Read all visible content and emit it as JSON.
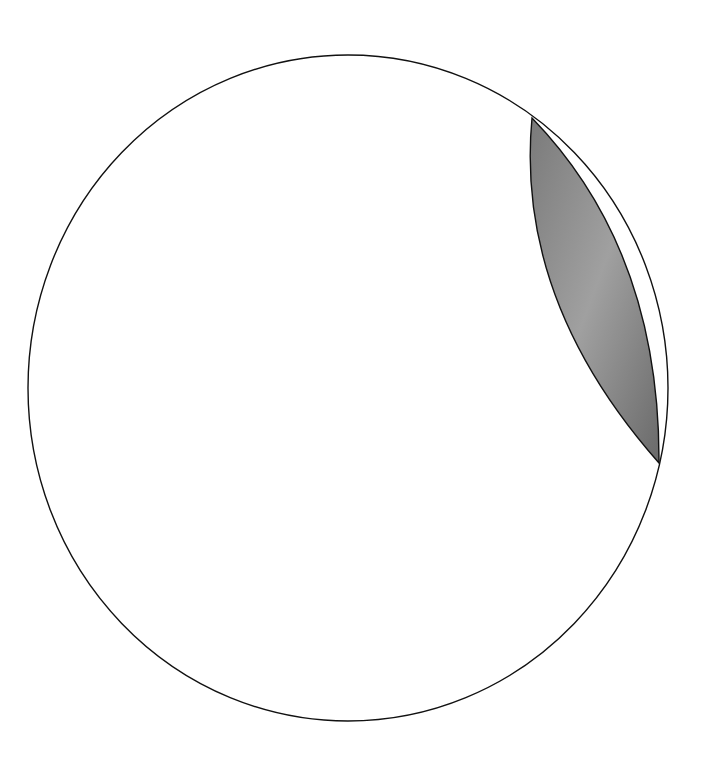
{
  "diagram": {
    "type": "circle-with-shaded-lens",
    "background": "#ffffff",
    "circle": {
      "cx": 348,
      "cy": 388,
      "rx": 320,
      "ry": 333,
      "stroke": "#111111",
      "fill": "#ffffff"
    },
    "lens": {
      "top_point": [
        532,
        118
      ],
      "bottom_point": [
        659,
        463
      ],
      "fill_dark": "#6e6e6e",
      "fill_light": "#a5a5a5",
      "stroke": "#111111"
    }
  }
}
